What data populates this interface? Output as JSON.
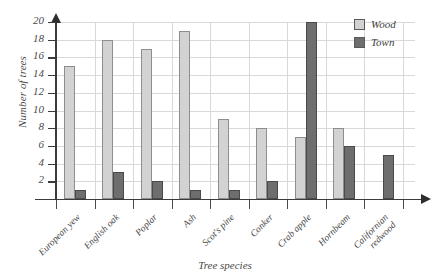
{
  "chart_data": {
    "type": "bar",
    "title": "",
    "xlabel": "Tree species",
    "ylabel": "Number of trees",
    "categories": [
      "European yew",
      "English oak",
      "Poplar",
      "Ash",
      "Scot's pine",
      "Conker",
      "Crab apple",
      "Hornbeam",
      "Californian redwood"
    ],
    "series": [
      {
        "name": "Wood",
        "color": "#d2d2d2",
        "values": [
          15,
          18,
          17,
          19,
          9,
          8,
          7,
          8,
          0
        ]
      },
      {
        "name": "Town",
        "color": "#6e6e6e",
        "values": [
          1,
          3,
          2,
          1,
          1,
          2,
          20,
          6,
          5
        ]
      }
    ],
    "ylim": [
      0,
      20
    ],
    "ytick_labels": [
      "20",
      "18",
      "16",
      "14",
      "12",
      "10",
      "8",
      "6",
      "4",
      "2"
    ],
    "ytick_values": [
      20,
      18,
      16,
      14,
      12,
      10,
      8,
      6,
      4,
      2
    ],
    "grid": true,
    "legend_position": "top-right"
  },
  "legend": {
    "entries": [
      {
        "label": "Wood"
      },
      {
        "label": "Town"
      }
    ]
  }
}
